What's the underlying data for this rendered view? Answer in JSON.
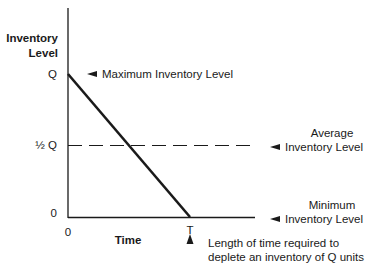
{
  "diagram": {
    "y_axis_title_line1": "Inventory",
    "y_axis_title_line2": "Level",
    "x_axis_title": "Time",
    "y_ticks": {
      "q": "Q",
      "half_q": "½ Q",
      "zero": "0"
    },
    "x_ticks": {
      "zero": "0",
      "t": "T"
    },
    "annotations": {
      "maximum": "Maximum Inventory Level",
      "average_line1": "Average",
      "average_line2": "Inventory Level",
      "minimum_line1": "Minimum",
      "minimum_line2": "Inventory Level",
      "time_line1": "Length of time required to",
      "time_line2": "deplete an inventory of Q units"
    },
    "colors": {
      "ink": "#1a1a1a",
      "background": "#ffffff"
    }
  }
}
